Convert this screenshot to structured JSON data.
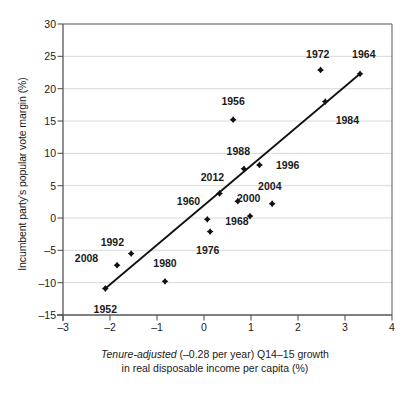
{
  "chart_data": {
    "type": "scatter",
    "title": "",
    "xlabel": "Tenure-adjusted (–0.28 per year) Q14–15 growth in real disposable income per capita (%)",
    "xlabel_line1_italic": "Tenure-adjusted",
    "xlabel_line1_rest": " (–0.28 per year) Q14–15 growth",
    "xlabel_line2": "in real disposable income per capita (%)",
    "ylabel": "Incumbent party's popular vote margin (%)",
    "xlim": [
      -3,
      4
    ],
    "ylim": [
      -15,
      30
    ],
    "xticks": [
      "–3",
      "–2",
      "–1",
      "0",
      "1",
      "2",
      "3",
      "4"
    ],
    "xtick_values": [
      -3,
      -2,
      -1,
      0,
      1,
      2,
      3,
      4
    ],
    "yticks": [
      "–15",
      "–10",
      "–5",
      "0",
      "5",
      "10",
      "15",
      "20",
      "25",
      "30"
    ],
    "ytick_values": [
      -15,
      -10,
      -5,
      0,
      5,
      10,
      15,
      20,
      25,
      30
    ],
    "grid": "horizontal",
    "legend": "none",
    "marker_color": "#111111",
    "line_color": "#111111",
    "axis_color": "#555555",
    "grid_color": "#d9d9d9",
    "points": [
      {
        "label": "1952",
        "x": -2.1,
        "y": -10.9,
        "lx": -2.1,
        "ly": -14.1,
        "anchor": "middle"
      },
      {
        "label": "2008",
        "x": -1.85,
        "y": -7.3,
        "lx": -2.5,
        "ly": -6.2,
        "anchor": "middle"
      },
      {
        "label": "1992",
        "x": -1.55,
        "y": -5.5,
        "lx": -1.95,
        "ly": -3.7,
        "anchor": "middle"
      },
      {
        "label": "1980",
        "x": -0.83,
        "y": -9.8,
        "lx": -0.83,
        "ly": -6.9,
        "anchor": "middle"
      },
      {
        "label": "1960",
        "x": 0.07,
        "y": -0.2,
        "lx": -0.33,
        "ly": 2.7,
        "anchor": "middle"
      },
      {
        "label": "1976",
        "x": 0.13,
        "y": -2.1,
        "lx": 0.08,
        "ly": -4.9,
        "anchor": "middle"
      },
      {
        "label": "2012",
        "x": 0.33,
        "y": 3.8,
        "lx": 0.18,
        "ly": 6.4,
        "anchor": "middle"
      },
      {
        "label": "1988",
        "x": 0.85,
        "y": 7.6,
        "lx": 0.73,
        "ly": 10.4,
        "anchor": "middle"
      },
      {
        "label": "1956",
        "x": 0.62,
        "y": 15.2,
        "lx": 0.62,
        "ly": 18.1,
        "anchor": "middle"
      },
      {
        "label": "1968",
        "x": 0.72,
        "y": 2.6,
        "lx": 0.7,
        "ly": -0.45,
        "anchor": "middle"
      },
      {
        "label": "2000",
        "x": 0.98,
        "y": 0.3,
        "lx": 0.95,
        "ly": 3.1,
        "anchor": "middle"
      },
      {
        "label": "2004",
        "x": 1.45,
        "y": 2.2,
        "lx": 1.4,
        "ly": 5.0,
        "anchor": "middle"
      },
      {
        "label": "1996",
        "x": 1.18,
        "y": 8.2,
        "lx": 1.78,
        "ly": 8.2,
        "anchor": "middle"
      },
      {
        "label": "1984",
        "x": 2.58,
        "y": 18.0,
        "lx": 3.05,
        "ly": 15.1,
        "anchor": "middle"
      },
      {
        "label": "1972",
        "x": 2.48,
        "y": 22.9,
        "lx": 2.42,
        "ly": 25.4,
        "anchor": "middle"
      },
      {
        "label": "1964",
        "x": 3.32,
        "y": 22.3,
        "lx": 3.4,
        "ly": 25.3,
        "anchor": "middle"
      }
    ],
    "fit_line": {
      "x0": -2.1,
      "y0": -10.9,
      "x1": 3.32,
      "y1": 22.3
    }
  }
}
